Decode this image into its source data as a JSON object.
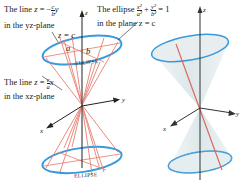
{
  "figure": {
    "left_panel": {
      "label_line_yz": {
        "prefix": "The line ",
        "var": "z",
        "eq": " = −",
        "frac_num": "c",
        "frac_den": "b",
        "suffix": "y",
        "line2": "in the yz-plane"
      },
      "label_line_xz": {
        "prefix": "The line ",
        "var": "z",
        "eq": " = ",
        "frac_num": "c",
        "frac_den": "a",
        "suffix": "x",
        "line2": "in the xz-plane"
      },
      "label_ellipse": {
        "prefix": "The ellipse ",
        "t1_num": "x²",
        "t1_den": "a²",
        "plus": " + ",
        "t2_num": "y²",
        "t2_den": "b²",
        "eq": " = 1",
        "line2": "in the plane z = c"
      },
      "plane_label": "z = c",
      "semi_axis_a": "a",
      "semi_axis_b": "b",
      "ellipse_top_text": "ELLIPSE",
      "ellipse_bottom_text": "ELLIPSE",
      "axis_z": "z",
      "axis_x": "x",
      "axis_y": "y"
    },
    "right_panel": {
      "axis_z": "z",
      "axis_x": "x",
      "axis_y": "y"
    },
    "colors": {
      "ellipse": "#3a9ad9",
      "lines": "#e8786a",
      "axes": "#222222",
      "cone_fill": "#e4eef0"
    }
  }
}
